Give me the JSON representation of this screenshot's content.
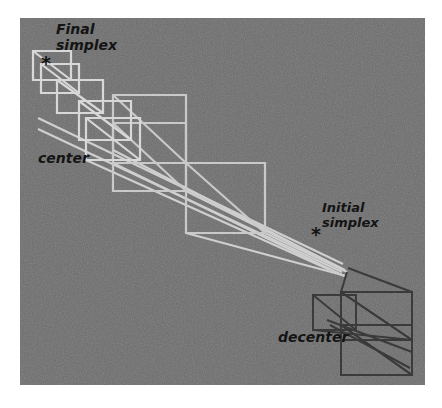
{
  "figure": {
    "name": "simplex-optimization-trajectory",
    "background_color": "#ffffff",
    "panel": {
      "x": 20,
      "y": 18,
      "width": 405,
      "height": 367,
      "fill": "#6e6e6e"
    },
    "scanline": {
      "x": 222,
      "color": "#7e7e7e"
    },
    "colors": {
      "final_simplex_stroke": "#d8d8d8",
      "initial_simplex_stroke": "#3a3a3a",
      "mid_simplex_stroke": "#c9c9c9",
      "label_text": "#141414",
      "panel_gray": "#6e6e6e"
    },
    "labels": [
      {
        "id": "final-simplex",
        "text_line1": "Final",
        "text_line2": "simplex",
        "x": 56,
        "y": 34,
        "font_size": 14
      },
      {
        "id": "center",
        "text": "center",
        "x": 38,
        "y": 163,
        "font_size": 14
      },
      {
        "id": "initial-simplex",
        "text_line1": "Initial",
        "text_line2": "simplex",
        "x": 322,
        "y": 212,
        "font_size": 13
      },
      {
        "id": "decenter",
        "text": "decenter",
        "x": 278,
        "y": 342,
        "font_size": 14
      }
    ],
    "markers": [
      {
        "id": "final-simplex-marker",
        "glyph": "*",
        "x": 41,
        "y": 70,
        "font_size": 19
      },
      {
        "id": "initial-simplex-marker",
        "glyph": "*",
        "x": 311,
        "y": 241,
        "font_size": 19
      }
    ],
    "chart_data": {
      "type": "line",
      "title": "Simplex optimization trajectory",
      "xlabel": "",
      "ylabel": "",
      "description": "Chain of parallelogram simplex outlines with internal diagonals, progressively contracting from the initial (dark) simplex at lower right toward the final (light) simplex at upper left.",
      "annotations": [
        "Final simplex",
        "center",
        "Initial simplex",
        "decenter"
      ],
      "series": [
        {
          "name": "final-simplex-quads",
          "stroke": "#d8d8d8",
          "stroke_width": 2.2,
          "quads": [
            {
              "id": "q1",
              "points": "33,51 71,51 71,80 33,80",
              "diagonals": [
                "33,51 71,80"
              ]
            },
            {
              "id": "q2",
              "points": "41,64 79,64 79,93 41,93",
              "diagonals": [
                "41,64 79,93"
              ]
            },
            {
              "id": "q3",
              "points": "57,80 103,80 103,113 57,113",
              "diagonals": [
                "57,80 103,113"
              ]
            },
            {
              "id": "q4",
              "points": "79,101 131,101 131,140 79,140",
              "diagonals": [
                "79,101 131,140"
              ]
            },
            {
              "id": "q5",
              "points": "86,118 140,118 140,160 86,160",
              "diagonals": [
                "86,118 140,160"
              ]
            }
          ]
        },
        {
          "name": "mid-simplex-quads",
          "stroke": "#c9c9c9",
          "stroke_width": 2.2,
          "quads": [
            {
              "id": "m1",
              "points": "113,95 186,95 186,163 113,163",
              "diagonals": [
                "113,95 186,163"
              ]
            },
            {
              "id": "m2",
              "points": "113,123 186,123 186,191 113,191",
              "diagonals": [
                "113,123 186,191"
              ]
            },
            {
              "id": "m3",
              "points": "186,163 265,163 265,233 186,233",
              "diagonals": [
                "186,163 265,233"
              ]
            }
          ]
        },
        {
          "name": "connector-lines",
          "stroke": "#cfcfcf",
          "stroke_width": 2.2,
          "lines": [
            "38,118 343,264",
            "38,129 342,272",
            "86,160 330,270",
            "113,150 340,268",
            "113,163 344,276",
            "186,191 345,270",
            "186,233 346,276",
            "265,233 347,272"
          ]
        },
        {
          "name": "initial-simplex-quads",
          "stroke": "#3a3a3a",
          "stroke_width": 2.0,
          "quads": [
            {
              "id": "i1",
              "points": "313,295 356,295 356,330 313,330",
              "diagonals": [
                "313,295 356,330"
              ]
            },
            {
              "id": "i2",
              "points": "341,292 412,292 412,340 341,340",
              "diagonals": [
                "341,292 412,340"
              ]
            },
            {
              "id": "i3",
              "points": "341,325 412,325 412,375 341,375",
              "diagonals": [
                "341,325 412,375"
              ]
            }
          ],
          "lines": [
            "341,292 412,340",
            "341,325 412,375",
            "313,330 412,340",
            "327,320 412,352",
            "330,325 410,368",
            "341,292 347,272",
            "412,292 348,268"
          ]
        }
      ]
    }
  }
}
